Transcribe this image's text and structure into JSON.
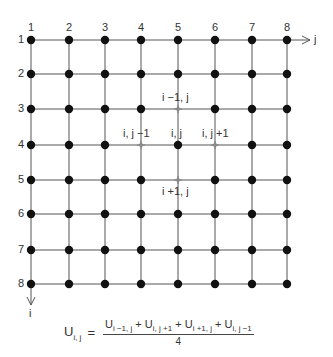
{
  "diagram": {
    "grid": {
      "rows": 8,
      "cols": 8,
      "row_labels": [
        "1",
        "2",
        "3",
        "4",
        "5",
        "6",
        "7",
        "8"
      ],
      "col_labels": [
        "1",
        "2",
        "3",
        "4",
        "5",
        "6",
        "7",
        "8"
      ],
      "x_positions": [
        31,
        69,
        105,
        141,
        178,
        215,
        252,
        287
      ],
      "y_positions": [
        40,
        74,
        109,
        145,
        180,
        214,
        250,
        284
      ],
      "node_color": "#111111",
      "line_color": "#555555",
      "neighbor_marker_color": "#8a8a8a"
    },
    "axes": {
      "j_label": "j",
      "i_label": "i"
    },
    "highlight": {
      "center": {
        "label": "i, j",
        "row": 4,
        "col": 5
      },
      "neighbors": [
        {
          "label": "i −1, j",
          "row": 3,
          "col": 5
        },
        {
          "label": "i, j −1",
          "row": 4,
          "col": 4
        },
        {
          "label": "i, j +1",
          "row": 4,
          "col": 6
        },
        {
          "label": "i +1, j",
          "row": 5,
          "col": 5
        }
      ]
    },
    "formula": {
      "lhs": "U",
      "lhs_sub": "i, j",
      "equals": "=",
      "numerator": [
        {
          "base": "U",
          "sub": "i −1, j"
        },
        {
          "op": "+"
        },
        {
          "base": "U",
          "sub": "i, j +1"
        },
        {
          "op": "+"
        },
        {
          "base": "U",
          "sub": "i +1, j"
        },
        {
          "op": "+"
        },
        {
          "base": "U",
          "sub": "i, j −1"
        }
      ],
      "denominator": "4"
    }
  }
}
